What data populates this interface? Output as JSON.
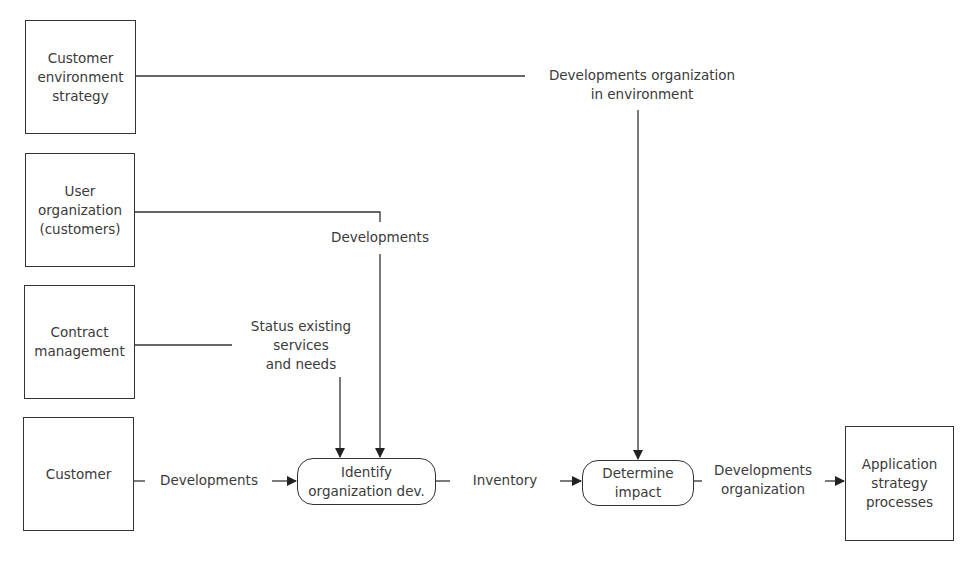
{
  "diagram": {
    "type": "data-flow",
    "sources": [
      {
        "id": "customer-environment-strategy",
        "label": "Customer\nenvironment\nstrategy"
      },
      {
        "id": "user-organization",
        "label": "User\norganization\n(customers)"
      },
      {
        "id": "contract-management",
        "label": "Contract\nmanagement"
      },
      {
        "id": "customer",
        "label": "Customer"
      }
    ],
    "processes": [
      {
        "id": "identify-organization-dev",
        "label": "Identify\norganization dev."
      },
      {
        "id": "determine-impact",
        "label": "Determine\nimpact"
      }
    ],
    "sink": {
      "id": "application-strategy-processes",
      "label": "Application\nstrategy\nprocesses"
    },
    "flows": [
      {
        "from": "customer-environment-strategy",
        "to": "determine-impact",
        "label": "Developments organization\nin environment"
      },
      {
        "from": "user-organization",
        "to": "identify-organization-dev",
        "label": "Developments"
      },
      {
        "from": "contract-management",
        "to": "identify-organization-dev",
        "label": "Status existing\nservices\nand needs"
      },
      {
        "from": "customer",
        "to": "identify-organization-dev",
        "label": "Developments"
      },
      {
        "from": "identify-organization-dev",
        "to": "determine-impact",
        "label": "Inventory"
      },
      {
        "from": "determine-impact",
        "to": "application-strategy-processes",
        "label": "Developments\norganization"
      }
    ]
  }
}
